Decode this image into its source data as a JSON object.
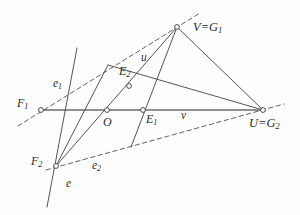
{
  "figure": {
    "stroke_color": "#4a4a52",
    "dashed_color": "#5a5a60",
    "axis_color": "#6b6b72",
    "label_color": "#2b2b2b",
    "background": "#fefefe",
    "width": 300,
    "height": 215
  },
  "labels": {
    "V_G1": {
      "text": "V=G",
      "sub": "1",
      "x": 193,
      "y": 21
    },
    "U_G2": {
      "text": "U=G",
      "sub": "2",
      "x": 249,
      "y": 117
    },
    "F1": {
      "text": "F",
      "sub": "1",
      "x": 17,
      "y": 97
    },
    "F2": {
      "text": "F",
      "sub": "2",
      "x": 31,
      "y": 155
    },
    "O": {
      "text": "O",
      "sub": "",
      "x": 103,
      "y": 116
    },
    "E1": {
      "text": "E",
      "sub": "1",
      "x": 146,
      "y": 113
    },
    "E2": {
      "text": "E",
      "sub": "2",
      "x": 119,
      "y": 65
    },
    "e": {
      "text": "e",
      "sub": "",
      "x": 66,
      "y": 178
    },
    "e1": {
      "text": "e",
      "sub": "1",
      "x": 53,
      "y": 78
    },
    "e2": {
      "text": "e",
      "sub": "2",
      "x": 92,
      "y": 160
    },
    "u": {
      "text": "u",
      "sub": "",
      "x": 141,
      "y": 52
    },
    "v": {
      "text": "v",
      "sub": "",
      "x": 181,
      "y": 110
    }
  },
  "points": [
    {
      "name": "V=G1",
      "x": 177,
      "y": 27
    },
    {
      "name": "U=G2",
      "x": 263,
      "y": 110
    },
    {
      "name": "F1",
      "x": 41,
      "y": 110
    },
    {
      "name": "F2",
      "x": 56,
      "y": 166
    },
    {
      "name": "O",
      "x": 107,
      "y": 110
    },
    {
      "name": "E1",
      "x": 143,
      "y": 110
    },
    {
      "name": "E2",
      "x": 129,
      "y": 86
    }
  ],
  "solid_lines": [
    {
      "name": "axis-F1-U",
      "x1": 41,
      "y1": 110,
      "x2": 263,
      "y2": 110
    },
    {
      "name": "line-V-U",
      "x1": 177,
      "y1": 27,
      "x2": 263,
      "y2": 110
    },
    {
      "name": "line-V-F2",
      "x1": 177,
      "y1": 27,
      "x2": 56,
      "y2": 166
    },
    {
      "name": "line-V-down",
      "x1": 177,
      "y1": 27,
      "x2": 131,
      "y2": 147
    },
    {
      "name": "line-E2-U",
      "x1": 108,
      "y1": 65,
      "x2": 263,
      "y2": 110
    },
    {
      "name": "line-e-steep",
      "x1": 77,
      "y1": 48,
      "x2": 47,
      "y2": 207
    },
    {
      "name": "line-F2-O-up",
      "x1": 56,
      "y1": 166,
      "x2": 108,
      "y2": 65
    }
  ],
  "dashed_lines": [
    {
      "name": "line-e1",
      "x1": 18,
      "y1": 126,
      "x2": 200,
      "y2": 13
    },
    {
      "name": "line-e2",
      "x1": 46,
      "y1": 170,
      "x2": 284,
      "y2": 104
    }
  ],
  "chart_data": {
    "type": "diagram",
    "annotations": [
      "V=G1",
      "U=G2",
      "F1",
      "F2",
      "O",
      "E1",
      "E2",
      "e",
      "e1",
      "e2",
      "u",
      "v"
    ]
  }
}
